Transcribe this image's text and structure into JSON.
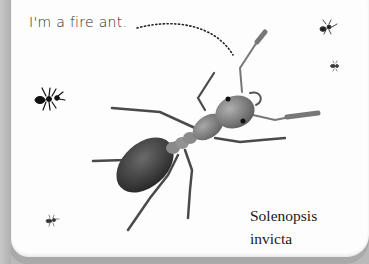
{
  "illustration": {
    "caption": "I'm a fire ant.",
    "species_line1": "Solenopsis",
    "species_line2": "invicta",
    "subject": "fire ant",
    "background_ants": 4,
    "colors": {
      "page": "#fdfdfd",
      "frame": "#b9b9b9",
      "ant_body": "#7a7a7a",
      "ant_gaster": "#3a3a3a",
      "text": "#1a1a1a"
    }
  }
}
